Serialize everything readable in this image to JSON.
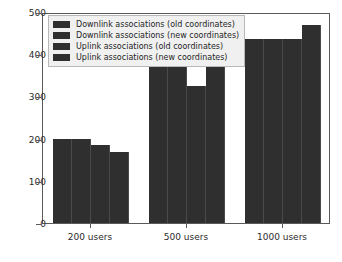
{
  "chart_data": {
    "type": "bar",
    "title": "",
    "xlabel": "",
    "ylabel": "",
    "categories": [
      "200 users",
      "500 users",
      "1000 users"
    ],
    "series": [
      {
        "name": "Downlink associations (old coordinates)",
        "color": "#2f2f2f",
        "values": [
          200,
          370,
          435
        ]
      },
      {
        "name": "Downlink associations (new coordinates)",
        "color": "#2f2f2f",
        "values": [
          200,
          370,
          435
        ]
      },
      {
        "name": "Uplink associations (old coordinates)",
        "color": "#2f2f2f",
        "values": [
          185,
          325,
          435
        ]
      },
      {
        "name": "Uplink associations (new coordinates)",
        "color": "#2f2f2f",
        "values": [
          168,
          370,
          470
        ]
      }
    ],
    "ylim": [
      0,
      500
    ],
    "yticks": [
      0,
      100,
      200,
      300,
      400,
      500
    ],
    "ytick_labels": [
      "0",
      "100",
      "200",
      "300",
      "400",
      "500"
    ],
    "grid": false,
    "legend_position": "upper left"
  },
  "legend": {
    "entries": [
      "Downlink associations (old coordinates)",
      "Downlink associations (new coordinates)",
      "Uplink associations (old coordinates)",
      "Uplink associations (new coordinates)"
    ]
  }
}
